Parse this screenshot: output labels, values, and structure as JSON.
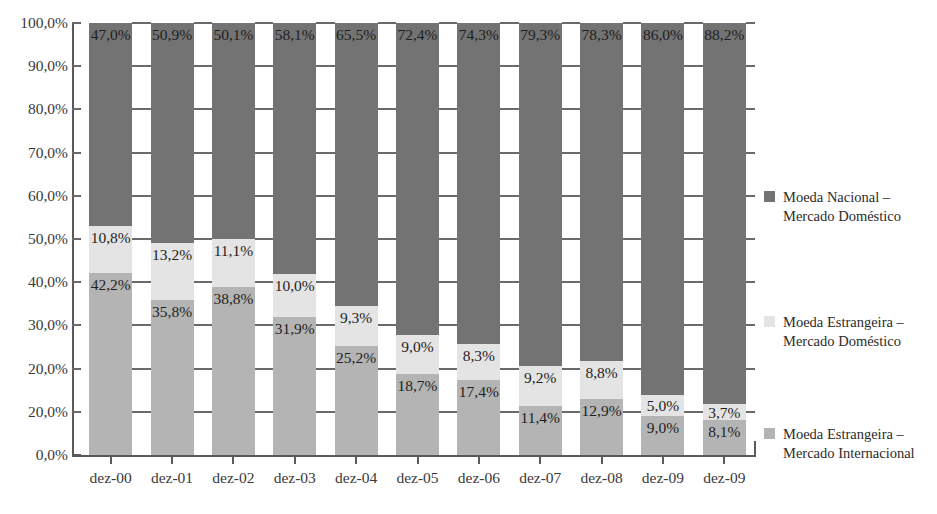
{
  "chart_data": {
    "type": "bar",
    "subtype": "stacked-percentage-column",
    "title": "",
    "xlabel": "",
    "ylabel": "",
    "ylim": [
      0,
      100
    ],
    "y_unit": "%",
    "grid": true,
    "legend_position": "right",
    "categories": [
      "dez-00",
      "dez-01",
      "dez-02",
      "dez-03",
      "dez-04",
      "dez-05",
      "dez-06",
      "dez-07",
      "dez-08",
      "dez-09",
      "dez-09"
    ],
    "y_tick_labels": [
      "100,0%",
      "90,0%",
      "80,0%",
      "70,0%",
      "60,0%",
      "50,0%",
      "40,0%",
      "30,0%",
      "20,0%",
      "20,0%",
      "0,0%"
    ],
    "y_tick_values": [
      100,
      90,
      80,
      70,
      60,
      50,
      40,
      30,
      20,
      10,
      0
    ],
    "series": [
      {
        "name": "Moeda Estrangeira – Mercado Internacional",
        "color": "#b4b4b4",
        "stack_order": 0,
        "values": [
          42.2,
          35.8,
          38.8,
          31.9,
          25.2,
          18.7,
          17.4,
          11.4,
          12.9,
          9.0,
          8.1
        ],
        "labels": [
          "42,2%",
          "35,8%",
          "38,8%",
          "31,9%",
          "25,2%",
          "18,7%",
          "17,4%",
          "11,4%",
          "12,9%",
          "9,0%",
          "8,1%"
        ]
      },
      {
        "name": "Moeda Estrangeira – Mercado Doméstico",
        "color": "#e4e4e4",
        "stack_order": 1,
        "values": [
          10.8,
          13.2,
          11.1,
          10.0,
          9.3,
          9.0,
          8.3,
          9.2,
          8.8,
          5.0,
          3.7
        ],
        "labels": [
          "10,8%",
          "13,2%",
          "11,1%",
          "10,0%",
          "9,3%",
          "9,0%",
          "8,3%",
          "9,2%",
          "8,8%",
          "5,0%",
          "3,7%"
        ]
      },
      {
        "name": "Moeda Nacional – Mercado Doméstico",
        "color": "#737373",
        "stack_order": 2,
        "values": [
          47.0,
          50.9,
          50.1,
          58.1,
          65.5,
          72.4,
          74.3,
          79.3,
          78.3,
          86.0,
          88.2
        ],
        "labels": [
          "47,0%",
          "50,9%",
          "50,1%",
          "58,1%",
          "65,5%",
          "72,4%",
          "74,3%",
          "79,3%",
          "78,3%",
          "86,0%",
          "88,2%"
        ]
      }
    ]
  },
  "legend": {
    "entries": [
      {
        "line1": "Moeda Nacional –",
        "line2": "Mercado Doméstico",
        "color": "#737373"
      },
      {
        "line1": "Moeda Estrangeira –",
        "line2": "Mercado Doméstico",
        "color": "#e4e4e4"
      },
      {
        "line1": "Moeda Estrangeira –",
        "line2": "Mercado Internacional",
        "color": "#b4b4b4"
      }
    ]
  },
  "axis": {
    "line_color": "#5a5a5a",
    "grid_color": "#6a6a6a"
  }
}
